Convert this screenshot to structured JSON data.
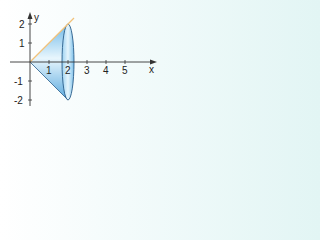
{
  "diagram": {
    "axes": {
      "x_label": "x",
      "y_label": "y",
      "x_ticks": [
        "1",
        "2",
        "3",
        "4",
        "5"
      ],
      "y_ticks": [
        "2",
        "1",
        "-1",
        "-2"
      ]
    },
    "curve": {
      "equation": "y = x",
      "color": "#f2c27a"
    },
    "solid": {
      "fill": "#8ccbf0",
      "outline": "#2a5d8a",
      "x_range": [
        0,
        2
      ]
    },
    "colors": {
      "axis": "#333333",
      "background_right": "#e2f5f4"
    }
  }
}
